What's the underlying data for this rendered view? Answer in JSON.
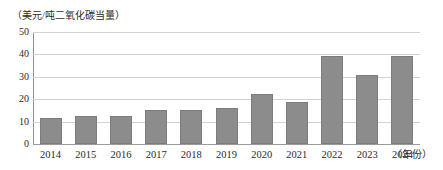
{
  "chart_data": {
    "type": "bar",
    "title": "",
    "subtitle": "",
    "xlabel": "（年份）",
    "ylabel": "（美元/吨二氧化碳当量）",
    "categories": [
      "2014",
      "2015",
      "2016",
      "2017",
      "2018",
      "2019",
      "2020",
      "2021",
      "2022",
      "2023",
      "2024"
    ],
    "values": [
      11.5,
      12.3,
      12.7,
      15.2,
      15.3,
      16.0,
      22.2,
      18.6,
      39.3,
      30.7,
      39.4
    ],
    "series": [
      {
        "name": "碳价",
        "values": [
          11.5,
          12.3,
          12.7,
          15.2,
          15.3,
          16.0,
          22.2,
          18.6,
          39.3,
          30.7,
          39.4
        ]
      }
    ],
    "ylim": [
      0,
      50
    ],
    "y_ticks": [
      "0",
      "10",
      "20",
      "30",
      "40",
      "50"
    ],
    "y_tick_values": [
      0,
      10,
      20,
      30,
      40,
      50
    ],
    "grid": true,
    "legend": false,
    "legend_position": "none",
    "bar_color": "#8c8c8c",
    "gridline_color": "#d2d2d2",
    "axis_color": "#8f8f8f"
  }
}
